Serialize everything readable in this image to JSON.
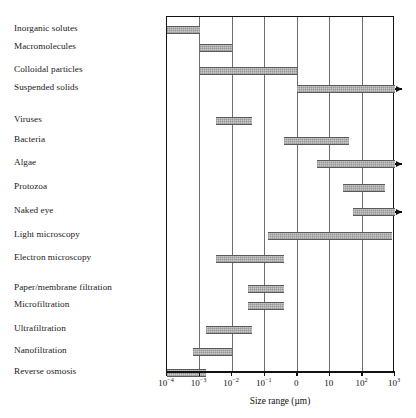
{
  "chart_data": {
    "type": "bar",
    "orientation": "horizontal-ranges",
    "title": "",
    "xlabel": "Size range (µm)",
    "ylabel": "",
    "xscale": "log",
    "xlim": [
      -4,
      3
    ],
    "grid": true,
    "legend": false,
    "xticks": [
      {
        "value": -4,
        "label": "10",
        "exp": "−4"
      },
      {
        "value": -3,
        "label": "10",
        "exp": "−3"
      },
      {
        "value": -2,
        "label": "10",
        "exp": "−2"
      },
      {
        "value": -1,
        "label": "10",
        "exp": "−1"
      },
      {
        "value": 0,
        "label": "0",
        "exp": ""
      },
      {
        "value": 1,
        "label": "10",
        "exp": ""
      },
      {
        "value": 2,
        "label": "10",
        "exp": "2"
      },
      {
        "value": 3,
        "label": "10",
        "exp": "3"
      }
    ],
    "categories": [
      "Inorganic solutes",
      "Macromolecules",
      "Colloidal particles",
      "Suspended solids",
      "Viruses",
      "Bacteria",
      "Algae",
      "Protozoa",
      "Naked eye",
      "Light microscopy",
      "Electron microscopy",
      "Paper/membrane filtration",
      "Microfiltration",
      "Ultrafiltration",
      "Nanofiltration",
      "Reverse osmosis"
    ],
    "ranges": [
      {
        "name": "Inorganic solutes",
        "start": -4.0,
        "end": -3.0,
        "arrow": false,
        "row": 0
      },
      {
        "name": "Macromolecules",
        "start": -3.0,
        "end": -2.0,
        "arrow": false,
        "row": 1
      },
      {
        "name": "Colloidal particles",
        "start": -3.0,
        "end": 0.0,
        "arrow": false,
        "row": 2
      },
      {
        "name": "Suspended solids",
        "start": 0.0,
        "end": 3.0,
        "arrow": true,
        "row": 3
      },
      {
        "name": "Viruses",
        "start": -2.5,
        "end": -1.4,
        "arrow": false,
        "row": 4
      },
      {
        "name": "Bacteria",
        "start": -0.4,
        "end": 1.6,
        "arrow": false,
        "row": 5
      },
      {
        "name": "Algae",
        "start": 0.6,
        "end": 3.0,
        "arrow": true,
        "row": 6
      },
      {
        "name": "Protozoa",
        "start": 1.4,
        "end": 2.7,
        "arrow": false,
        "row": 7
      },
      {
        "name": "Naked eye",
        "start": 1.7,
        "end": 3.0,
        "arrow": true,
        "row": 8
      },
      {
        "name": "Light microscopy",
        "start": -0.9,
        "end": 2.9,
        "arrow": false,
        "row": 9
      },
      {
        "name": "Electron microscopy",
        "start": -2.5,
        "end": -0.4,
        "arrow": false,
        "row": 10
      },
      {
        "name": "Paper/membrane filtration",
        "start": -1.5,
        "end": -0.4,
        "arrow": false,
        "row": 11
      },
      {
        "name": "Microfiltration",
        "start": -1.5,
        "end": -0.4,
        "arrow": false,
        "row": 12
      },
      {
        "name": "Ultrafiltration",
        "start": -2.8,
        "end": -1.4,
        "arrow": false,
        "row": 13
      },
      {
        "name": "Nanofiltration",
        "start": -3.2,
        "end": -2.0,
        "arrow": false,
        "row": 14
      },
      {
        "name": "Reverse osmosis",
        "start": -4.0,
        "end": -2.8,
        "arrow": false,
        "row": 15
      }
    ],
    "colors": {
      "bar_fill": "#c9c9c9",
      "bar_edge": "#5a5a5a",
      "frame": "#111111",
      "gridline": "#6d6d6d",
      "text": "#111111",
      "background": "#ffffff"
    }
  },
  "labels": {
    "rows": [
      {
        "text": "Inorganic solutes",
        "y": 23
      },
      {
        "text": "Macromolecules",
        "y": 41
      },
      {
        "text": "Colloidal particles",
        "y": 64
      },
      {
        "text": "Suspended solids",
        "y": 82
      },
      {
        "text": "Viruses",
        "y": 114
      },
      {
        "text": "Bacteria",
        "y": 134
      },
      {
        "text": "Algae",
        "y": 157
      },
      {
        "text": "Protozoa",
        "y": 181
      },
      {
        "text": "Naked eye",
        "y": 205
      },
      {
        "text": "Light microscopy",
        "y": 229
      },
      {
        "text": "Electron microscopy",
        "y": 252
      },
      {
        "text": "Paper/membrane filtration",
        "y": 282
      },
      {
        "text": "Microfiltration",
        "y": 299
      },
      {
        "text": "Ultrafiltration",
        "y": 323
      },
      {
        "text": "Nanofiltration",
        "y": 345
      },
      {
        "text": "Reverse osmosis",
        "y": 366
      }
    ]
  }
}
